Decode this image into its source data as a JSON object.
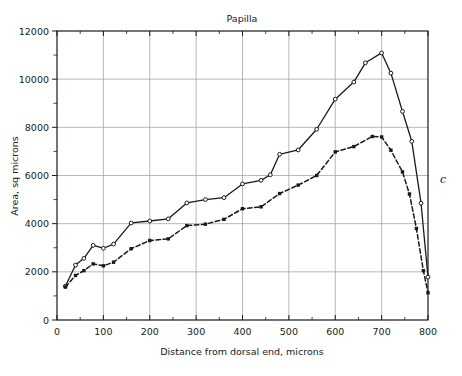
{
  "chart_data": {
    "type": "line",
    "title": "Papilla",
    "xlabel": "Distance from dorsal end, microns",
    "ylabel": "Area, sq microns",
    "xlim": [
      0,
      800
    ],
    "ylim": [
      0,
      12000
    ],
    "grid": true,
    "legend_position": "none",
    "panel_label": "c",
    "xticks": [
      0,
      100,
      200,
      300,
      400,
      500,
      600,
      700,
      800
    ],
    "xtick_labels": [
      "0",
      "100",
      "200",
      "300",
      "400",
      "500",
      "600",
      "700",
      "800"
    ],
    "xminor_ticks": [
      50,
      150,
      250,
      350,
      450,
      550,
      650,
      750
    ],
    "yticks": [
      0,
      2000,
      4000,
      6000,
      8000,
      10000,
      12000
    ],
    "ytick_labels": [
      "0",
      "2000",
      "4000",
      "6000",
      "8000",
      "10000",
      "12000"
    ],
    "yminor_ticks": [
      1000,
      3000,
      5000,
      7000,
      9000,
      11000
    ],
    "series": [
      {
        "name": "total area",
        "style": "solid",
        "marker": "open-circle",
        "color": "#1a1a1a",
        "points": [
          [
            18,
            1400
          ],
          [
            40,
            2280
          ],
          [
            58,
            2560
          ],
          [
            78,
            3100
          ],
          [
            100,
            2980
          ],
          [
            122,
            3150
          ],
          [
            160,
            4030
          ],
          [
            200,
            4110
          ],
          [
            240,
            4200
          ],
          [
            280,
            4860
          ],
          [
            320,
            5000
          ],
          [
            360,
            5080
          ],
          [
            400,
            5650
          ],
          [
            440,
            5800
          ],
          [
            460,
            6030
          ],
          [
            480,
            6880
          ],
          [
            520,
            7060
          ],
          [
            560,
            7920
          ],
          [
            600,
            9170
          ],
          [
            640,
            9880
          ],
          [
            665,
            10680
          ],
          [
            700,
            11090
          ],
          [
            720,
            10250
          ],
          [
            745,
            8660
          ],
          [
            765,
            7420
          ],
          [
            785,
            4850
          ],
          [
            800,
            1780
          ]
        ]
      },
      {
        "name": "cellular area",
        "style": "dashed",
        "marker": "filled-square",
        "color": "#1a1a1a",
        "points": [
          [
            18,
            1370
          ],
          [
            40,
            1850
          ],
          [
            58,
            2050
          ],
          [
            78,
            2330
          ],
          [
            100,
            2250
          ],
          [
            122,
            2400
          ],
          [
            160,
            2960
          ],
          [
            200,
            3300
          ],
          [
            240,
            3370
          ],
          [
            280,
            3920
          ],
          [
            320,
            3980
          ],
          [
            360,
            4180
          ],
          [
            400,
            4620
          ],
          [
            440,
            4700
          ],
          [
            480,
            5250
          ],
          [
            520,
            5600
          ],
          [
            560,
            6000
          ],
          [
            600,
            6980
          ],
          [
            640,
            7200
          ],
          [
            680,
            7620
          ],
          [
            700,
            7600
          ],
          [
            720,
            7050
          ],
          [
            745,
            6150
          ],
          [
            760,
            5230
          ],
          [
            775,
            3800
          ],
          [
            790,
            2050
          ],
          [
            800,
            1130
          ]
        ]
      }
    ]
  }
}
